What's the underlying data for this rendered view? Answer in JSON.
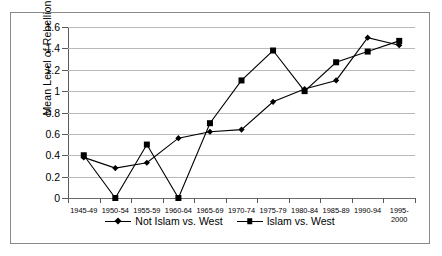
{
  "chart_data": {
    "type": "line",
    "title": "",
    "xlabel": "",
    "ylabel": "Mean Level of Rebellion",
    "ylim": [
      0,
      1.6
    ],
    "ytick_labels": [
      "0",
      "0.2",
      "0.4",
      "0.6",
      "0.8",
      "1",
      "1.2",
      "1.4",
      "1.6"
    ],
    "ytick_values": [
      0,
      0.2,
      0.4,
      0.6,
      0.8,
      1.0,
      1.2,
      1.4,
      1.6
    ],
    "grid": true,
    "legend_position": "bottom",
    "categories": [
      "1945-49",
      "1950-54",
      "1955-59",
      "1960-64",
      "1965-69",
      "1970-74",
      "1975-79",
      "1980-84",
      "1985-89",
      "1990-94",
      "1995-2000"
    ],
    "series": [
      {
        "name": "Not Islam vs. West",
        "marker": "diamond",
        "values": [
          0.38,
          0.28,
          0.33,
          0.56,
          0.62,
          0.64,
          0.9,
          1.02,
          1.1,
          1.5,
          1.43
        ]
      },
      {
        "name": "Islam vs. West",
        "marker": "square",
        "values": [
          0.4,
          0.0,
          0.5,
          0.0,
          0.7,
          1.1,
          1.38,
          1.0,
          1.27,
          1.37,
          1.47
        ]
      }
    ]
  },
  "colors": {
    "line": "#000000",
    "grid": "#b9b9b9",
    "axis": "#5a5a5a",
    "border": "#8a8a8a",
    "background": "#ffffff"
  }
}
